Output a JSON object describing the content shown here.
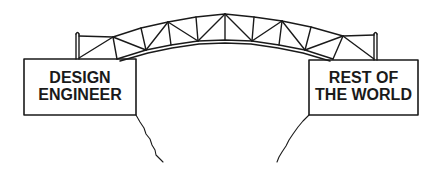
{
  "diagram": {
    "type": "cartoon-illustration",
    "left_sign": {
      "line1": "DESIGN",
      "line2": "ENGINEER"
    },
    "right_sign": {
      "line1": "REST OF",
      "line2": "THE WORLD"
    },
    "elements": [
      "truss-bridge",
      "left-cliff",
      "right-cliff",
      "left-post",
      "right-post"
    ],
    "colors": {
      "ink": "#1a1a1a",
      "background": "#ffffff"
    }
  }
}
